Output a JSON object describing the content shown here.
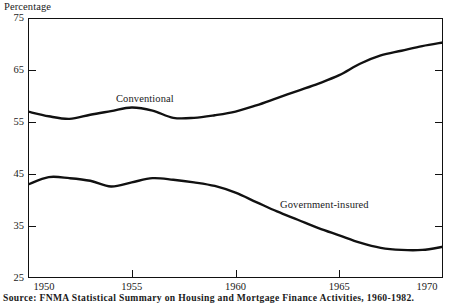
{
  "figure": {
    "yaxis_title": "Percentage",
    "source_note": "Source: FNMA Statistical Summary on Housing and Mortgage Finance Activities, 1960-1982."
  },
  "chart_data": {
    "type": "line",
    "title": "",
    "xlabel": "",
    "ylabel": "Percentage",
    "xlim": [
      1950,
      1970
    ],
    "ylim": [
      25,
      75
    ],
    "xticks": [
      1950,
      1955,
      1960,
      1965,
      1970
    ],
    "yticks": [
      25,
      35,
      45,
      55,
      65,
      75
    ],
    "grid": false,
    "legend": "inline-annotations",
    "x": [
      1950,
      1951,
      1952,
      1953,
      1954,
      1955,
      1956,
      1957,
      1958,
      1959,
      1960,
      1961,
      1962,
      1963,
      1964,
      1965,
      1966,
      1967,
      1968,
      1969,
      1970
    ],
    "series": [
      {
        "name": "Conventional",
        "label_position": {
          "x": 1955.6,
          "y": 61.5
        },
        "values": [
          57.0,
          56.1,
          55.6,
          56.4,
          57.1,
          57.8,
          57.2,
          55.8,
          55.8,
          56.3,
          57.0,
          58.2,
          59.6,
          61.0,
          62.4,
          64.0,
          66.2,
          67.8,
          68.7,
          69.6,
          70.3
        ]
      },
      {
        "name": "Government-insured",
        "label_position": {
          "x": 1962.6,
          "y": 39.0
        },
        "values": [
          43.0,
          44.4,
          44.2,
          43.7,
          42.6,
          43.4,
          44.2,
          43.9,
          43.4,
          42.7,
          41.4,
          39.6,
          37.8,
          36.2,
          34.6,
          33.2,
          31.8,
          30.8,
          30.4,
          30.4,
          31.0
        ]
      }
    ]
  }
}
